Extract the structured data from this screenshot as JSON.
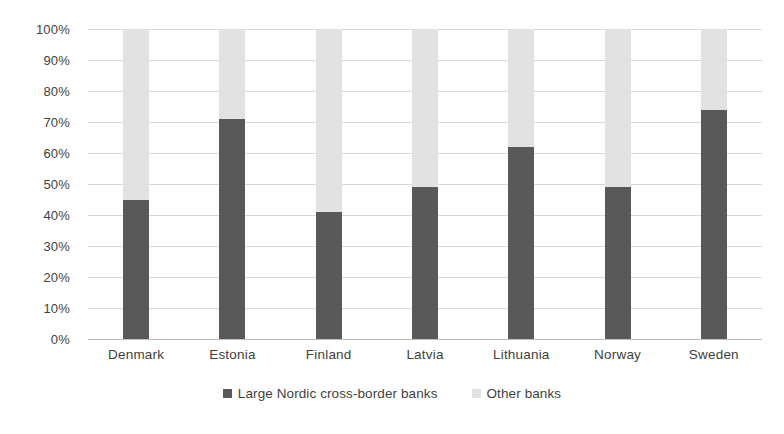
{
  "chart_data": {
    "type": "bar",
    "subtype": "stacked-100-percent",
    "title": "",
    "xlabel": "",
    "ylabel": "",
    "categories": [
      "Denmark",
      "Estonia",
      "Finland",
      "Latvia",
      "Lithuania",
      "Norway",
      "Sweden"
    ],
    "series": [
      {
        "name": "Large Nordic cross-border banks",
        "color": "#595959",
        "values": [
          45,
          71,
          41,
          49,
          62,
          49,
          74
        ]
      },
      {
        "name": "Other banks",
        "color": "#e2e2e2",
        "values": [
          55,
          29,
          59,
          51,
          38,
          51,
          26
        ]
      }
    ],
    "ylim": [
      0,
      100
    ],
    "y_ticks": [
      "0%",
      "10%",
      "20%",
      "30%",
      "40%",
      "50%",
      "60%",
      "70%",
      "80%",
      "90%",
      "100%"
    ],
    "y_tick_values": [
      0,
      10,
      20,
      30,
      40,
      50,
      60,
      70,
      80,
      90,
      100
    ],
    "grid": true,
    "legend_position": "bottom"
  },
  "colors": {
    "large_banks": "#595959",
    "other_banks": "#e2e2e2",
    "gridline": "#d9d9d9",
    "text": "#3f3f3f",
    "background": "#ffffff"
  }
}
